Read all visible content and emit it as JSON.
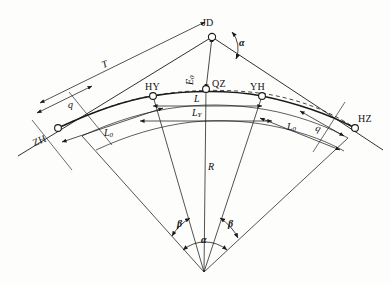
{
  "diagram": {
    "type": "survey-geometry",
    "background_color": "#fdfdfc",
    "line_color": "#1a1a1a",
    "points": [
      {
        "id": "JD",
        "label": "JD",
        "x": 212,
        "y": 37,
        "desc": "intersection-point"
      },
      {
        "id": "ZH",
        "label": "ZH",
        "x": 58,
        "y": 128,
        "desc": "tangent-to-spiral"
      },
      {
        "id": "HY",
        "label": "HY",
        "x": 153,
        "y": 96,
        "desc": "spiral-to-curve"
      },
      {
        "id": "QZ",
        "label": "QZ",
        "x": 206,
        "y": 89,
        "desc": "curve-midpoint"
      },
      {
        "id": "YH",
        "label": "YH",
        "x": 262,
        "y": 96,
        "desc": "curve-to-spiral"
      },
      {
        "id": "HZ",
        "label": "HZ",
        "x": 355,
        "y": 128,
        "desc": "spiral-to-tangent"
      },
      {
        "id": "O",
        "label": "",
        "x": 204,
        "y": 272,
        "desc": "curve-center"
      }
    ],
    "dimensions": [
      {
        "id": "T",
        "label": "T",
        "sub": "",
        "x": 107,
        "y": 56,
        "rot": "neg",
        "desc": "tangent-length"
      },
      {
        "id": "q",
        "label": "q",
        "sub": "",
        "x": 70,
        "y": 105,
        "rot": "neg",
        "desc": "tangent-increment-left"
      },
      {
        "id": "q2",
        "label": "q",
        "sub": "",
        "x": 318,
        "y": 118,
        "rot": "pos",
        "desc": "tangent-increment-right"
      },
      {
        "id": "E0",
        "label": "E",
        "sub": "0",
        "x": 198,
        "y": 70,
        "rot": "vert",
        "desc": "external-distance"
      },
      {
        "id": "L",
        "label": "L",
        "sub": "",
        "x": 196,
        "y": 104,
        "rot": "",
        "desc": "total-curve-length"
      },
      {
        "id": "LY",
        "label": "L",
        "sub": "Y",
        "x": 196,
        "y": 117,
        "rot": "",
        "desc": "circular-curve-length"
      },
      {
        "id": "L0L",
        "label": "L",
        "sub": "0",
        "x": 107,
        "y": 135,
        "rot": "",
        "desc": "spiral-length-left"
      },
      {
        "id": "L0R",
        "label": "L",
        "sub": "0",
        "x": 290,
        "y": 130,
        "rot": "",
        "desc": "spiral-length-right"
      },
      {
        "id": "R",
        "label": "R",
        "sub": "",
        "x": 210,
        "y": 168,
        "rot": "",
        "desc": "radius"
      }
    ],
    "angles": [
      {
        "id": "alpha-top",
        "label": "α",
        "x": 231,
        "y": 44,
        "desc": "deflection-angle-at-JD"
      },
      {
        "id": "beta-left",
        "label": "β",
        "x": 181,
        "y": 226,
        "desc": "spiral-angle-left"
      },
      {
        "id": "beta-right",
        "label": "β",
        "x": 231,
        "y": 226,
        "desc": "spiral-angle-right"
      },
      {
        "id": "alpha-center",
        "label": "α",
        "x": 205,
        "y": 242,
        "desc": "central-angle"
      }
    ]
  }
}
